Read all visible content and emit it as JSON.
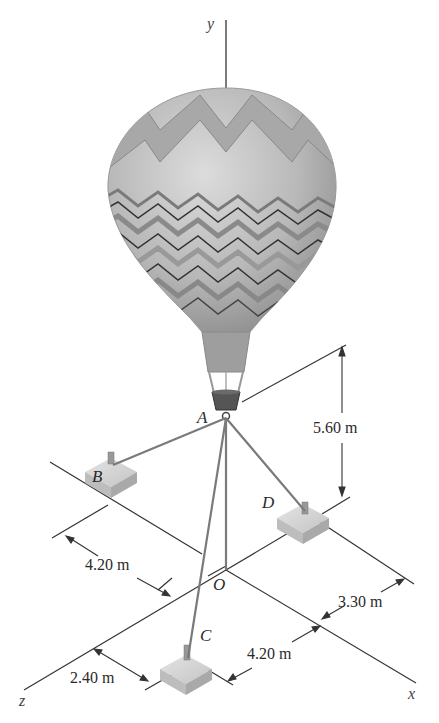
{
  "diagram": {
    "axes": {
      "x": "x",
      "y": "y",
      "z": "z",
      "origin": "O"
    },
    "points": {
      "A": "A",
      "B": "B",
      "C": "C",
      "D": "D",
      "O": "O"
    },
    "dimensions": {
      "height_A": "5.60 m",
      "B_offset": "4.20 m",
      "D_offset": "3.30 m",
      "C_x_offset": "4.20 m",
      "C_z_offset": "2.40 m"
    },
    "colors": {
      "line": "#333333",
      "balloon_light": "#c9c9c9",
      "balloon_dark": "#8a8a8a",
      "anchor_block": "#cfcfcf"
    }
  }
}
